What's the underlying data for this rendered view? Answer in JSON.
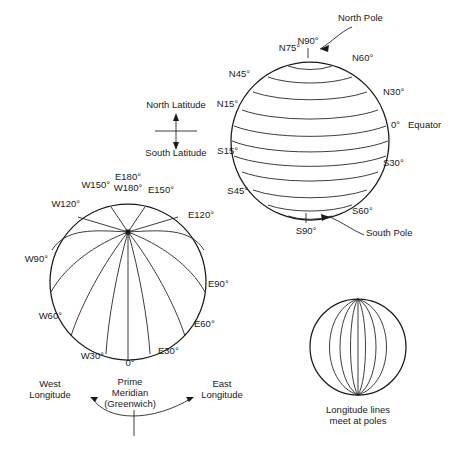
{
  "figure": {
    "title_visible": false,
    "background_color": "#ffffff",
    "line_color": "#1a1a1a",
    "text_color": "#1a1a1a"
  },
  "latitude_globe": {
    "name": "latitude-globe",
    "pole_labels": {
      "north_pole": "North Pole",
      "south_pole": "South Pole"
    },
    "labels": [
      {
        "text": "N90°",
        "anchor": "middle"
      },
      {
        "text": "N75°",
        "anchor": "end"
      },
      {
        "text": "N60°",
        "anchor": "start"
      },
      {
        "text": "N45°",
        "anchor": "end"
      },
      {
        "text": "N30°",
        "anchor": "start"
      },
      {
        "text": "N15°",
        "anchor": "end"
      },
      {
        "text": "0°",
        "anchor": "start"
      },
      {
        "text": "Equator",
        "anchor": "start"
      },
      {
        "text": "S15°",
        "anchor": "end"
      },
      {
        "text": "S30°",
        "anchor": "start"
      },
      {
        "text": "S45°",
        "anchor": "end"
      },
      {
        "text": "S60°",
        "anchor": "start"
      },
      {
        "text": "S90°",
        "anchor": "middle"
      }
    ]
  },
  "latitude_key": {
    "name": "latitude-direction-key",
    "north": "North Latitude",
    "south": "South Latitude"
  },
  "longitude_globe": {
    "name": "longitude-globe",
    "labels": [
      {
        "text": "E180°",
        "anchor": "middle"
      },
      {
        "text": "W180°",
        "anchor": "middle"
      },
      {
        "text": "W150°",
        "anchor": "end"
      },
      {
        "text": "E150°",
        "anchor": "start"
      },
      {
        "text": "W120°",
        "anchor": "end"
      },
      {
        "text": "E120°",
        "anchor": "start"
      },
      {
        "text": "W90°",
        "anchor": "end"
      },
      {
        "text": "E90°",
        "anchor": "start"
      },
      {
        "text": "W60°",
        "anchor": "end"
      },
      {
        "text": "E60°",
        "anchor": "start"
      },
      {
        "text": "W30°",
        "anchor": "end"
      },
      {
        "text": "E30°",
        "anchor": "start"
      },
      {
        "text": "0°",
        "anchor": "middle"
      }
    ]
  },
  "longitude_key": {
    "name": "longitude-direction-key",
    "west_line1": "West",
    "west_line2": "Longitude",
    "center_line1": "Prime",
    "center_line2": "Meridian",
    "center_line3": "(Greenwich)",
    "east_line1": "East",
    "east_line2": "Longitude"
  },
  "pole_convergence_globe": {
    "name": "pole-convergence-globe",
    "caption_line1": "Longitude lines",
    "caption_line2": "meet at poles",
    "meridian_count": 7
  }
}
